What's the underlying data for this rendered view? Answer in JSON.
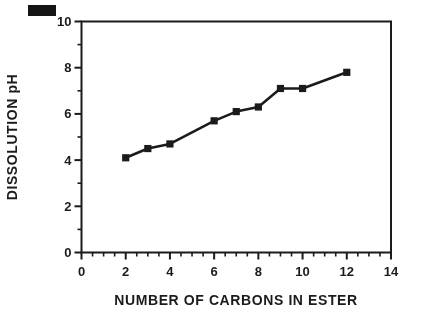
{
  "figure": {
    "background": "#ffffff",
    "ink_color": "#1b1b1b",
    "corner_mark": "solid-black-rectangle-scan-artifact"
  },
  "chart_data": {
    "type": "line",
    "xlabel": "NUMBER OF CARBONS IN ESTER",
    "ylabel": "DISSOLUTION pH",
    "x": [
      2,
      3,
      4,
      6,
      7,
      8,
      9,
      10,
      12
    ],
    "y": [
      4.1,
      4.5,
      4.7,
      5.7,
      6.1,
      6.3,
      7.1,
      7.1,
      7.8
    ],
    "xlim": [
      0,
      14
    ],
    "ylim": [
      0,
      10
    ],
    "x_major_ticks": [
      0,
      2,
      4,
      6,
      8,
      10,
      12,
      14
    ],
    "x_minor_step": 0.5,
    "y_major_ticks": [
      0,
      2,
      4,
      6,
      8,
      10
    ],
    "y_minor_step": 1,
    "grid": false,
    "legend": null,
    "marker": "filled-square",
    "line_color": "#1b1b1b"
  }
}
